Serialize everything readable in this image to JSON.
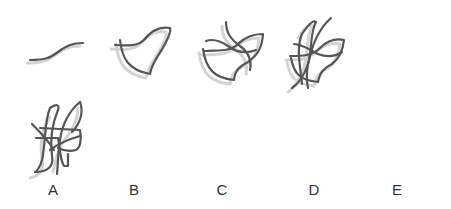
{
  "figure": {
    "colors": {
      "stroke": "#555555",
      "shadow": "#d4d4d4",
      "background": "#ffffff",
      "label": "#333333"
    },
    "sequence": [
      {
        "id": "step-1",
        "curve_count": 1
      },
      {
        "id": "step-2",
        "curve_count": 2
      },
      {
        "id": "step-3",
        "curve_count": 3
      },
      {
        "id": "step-4",
        "curve_count": 4
      }
    ],
    "options": [
      {
        "id": "option-a",
        "label": "A"
      },
      {
        "id": "option-b",
        "label": "B"
      },
      {
        "id": "option-c",
        "label": "C"
      },
      {
        "id": "option-d",
        "label": "D"
      },
      {
        "id": "option-e",
        "label": "E"
      }
    ]
  }
}
